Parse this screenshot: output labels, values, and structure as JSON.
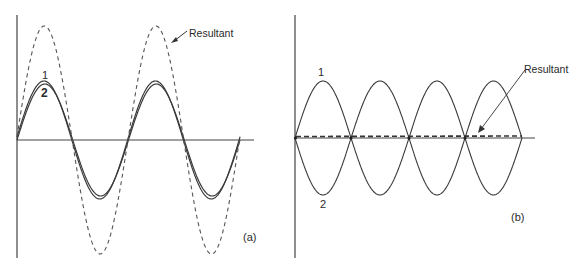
{
  "figure": {
    "panel_a": {
      "tag": "(a)",
      "curve1_label": "1",
      "curve2_label": "2",
      "resultant_label": "Resultant",
      "description": "Two waves nearly in phase; resultant has about double amplitude"
    },
    "panel_b": {
      "tag": "(b)",
      "curve1_label": "1",
      "curve2_label": "2",
      "resultant_label": "Resultant",
      "description": "Two waves 180 degrees out of phase; resultant is nearly zero"
    }
  },
  "colors": {
    "line": "#3a3a3a",
    "axis": "#444444",
    "background": "#ffffff"
  }
}
